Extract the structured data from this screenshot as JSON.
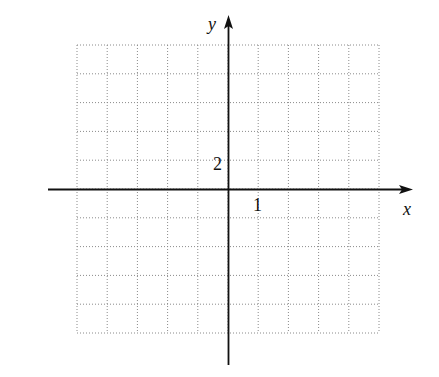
{
  "chart_data": {
    "type": "scatter",
    "title": "",
    "xlabel": "x",
    "ylabel": "y",
    "grid": true,
    "grid_style": "dotted",
    "x_tick_labels": [
      {
        "value": 1,
        "label": "1"
      }
    ],
    "y_tick_labels": [
      {
        "value": 2,
        "label": "2"
      }
    ],
    "x_grid_step": 1,
    "y_grid_step": 2,
    "xlim": [
      -5,
      5
    ],
    "ylim": [
      -10,
      10
    ],
    "series": [],
    "grid_columns": 10,
    "grid_rows": 10
  },
  "layout": {
    "grid_left": 77,
    "grid_right": 379,
    "grid_top": 45,
    "grid_bottom": 333,
    "origin_x": 228.5,
    "origin_y": 189.5,
    "x_axis_start": 48,
    "x_axis_end": 413,
    "y_axis_start": 365,
    "y_axis_end": 15
  },
  "labels": {
    "x_axis": "x",
    "y_axis": "y",
    "x_tick": "1",
    "y_tick": "2"
  }
}
